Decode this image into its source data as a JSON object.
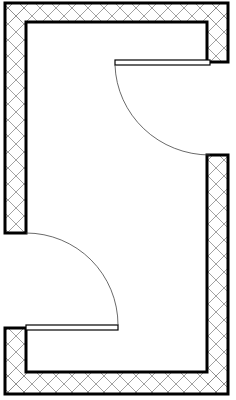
{
  "diagram": {
    "type": "floor-plan",
    "colors": {
      "background": "#ffffff",
      "wall_outline": "#000000",
      "hatch": "#8a8a8a",
      "door_line": "#000000",
      "swing_arc": "#444444"
    },
    "walls": {
      "outer": {
        "x1": 5,
        "y1": 3,
        "x2": 228,
        "y2": 394
      },
      "inner": {
        "x1": 26,
        "y1": 22,
        "x2": 207,
        "y2": 372
      }
    },
    "doors": [
      {
        "name": "door-top-right",
        "wall": "right",
        "gap_y": [
          62,
          155
        ],
        "leaf": {
          "x1": 115,
          "y1": 60,
          "x2": 210,
          "y2": 65
        },
        "hinge": {
          "x": 210,
          "y": 62
        },
        "swing_to": {
          "x": 210,
          "y": 155
        }
      },
      {
        "name": "door-bottom-left",
        "wall": "left",
        "gap_y": [
          233,
          328
        ],
        "leaf": {
          "x1": 26,
          "y1": 325,
          "x2": 118,
          "y2": 330
        },
        "hinge": {
          "x": 26,
          "y": 328
        },
        "swing_to": {
          "x": 26,
          "y": 233
        }
      }
    ]
  }
}
